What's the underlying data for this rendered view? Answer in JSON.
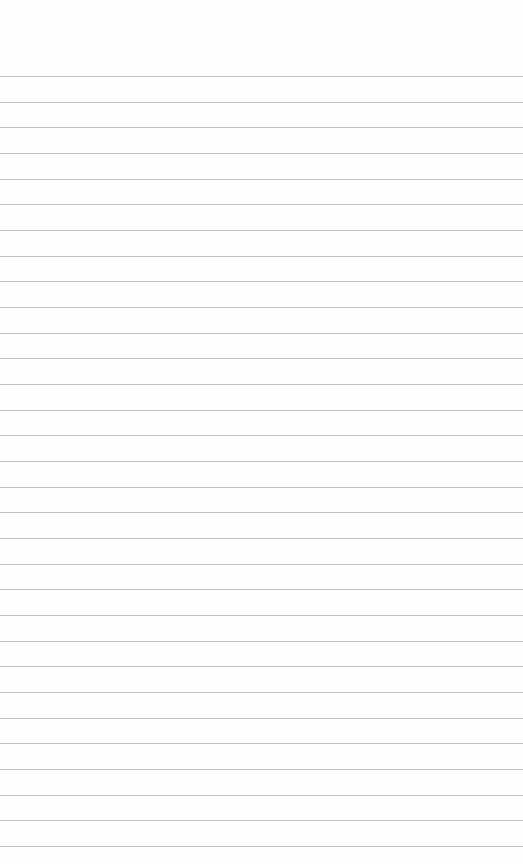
{
  "page": {
    "background": "#fefefe",
    "line_color": "#c2c2c2",
    "first_line_y": 76,
    "line_spacing": 25.67,
    "line_count": 31
  }
}
